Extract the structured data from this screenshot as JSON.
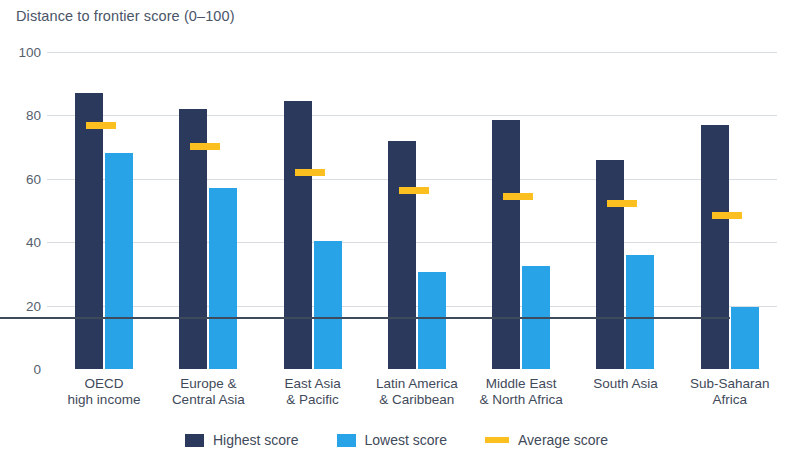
{
  "chart_data": {
    "type": "bar",
    "title": "Distance to frontier score (0–100)",
    "xlabel": "",
    "ylabel": "",
    "ylim": [
      0,
      100
    ],
    "yticks": [
      0,
      20,
      40,
      60,
      80,
      100
    ],
    "ytick_labels": [
      "0",
      "20",
      "40",
      "60",
      "80",
      "100"
    ],
    "grid": true,
    "legend_position": "bottom",
    "categories": [
      "OECD high income",
      "Europe & Central Asia",
      "East Asia & Pacific",
      "Latin America & Caribbean",
      "Middle East & North Africa",
      "South Asia",
      "Sub-Saharan Africa"
    ],
    "category_lines": [
      [
        "OECD",
        "high income"
      ],
      [
        "Europe &",
        "Central Asia"
      ],
      [
        "East Asia",
        "& Pacific"
      ],
      [
        "Latin America",
        "& Caribbean"
      ],
      [
        "Middle East",
        "& North Africa"
      ],
      [
        "South Asia"
      ],
      [
        "Sub-Saharan",
        "Africa"
      ]
    ],
    "series": [
      {
        "name": "Highest score",
        "color": "#2b3a5c",
        "values": [
          87,
          82,
          84.5,
          72,
          78.5,
          66,
          77
        ]
      },
      {
        "name": "Lowest score",
        "color": "#29a3e8",
        "values": [
          68,
          57,
          40.5,
          30.5,
          32.5,
          36,
          19.5
        ]
      },
      {
        "name": "Average score",
        "color": "#fbc01f",
        "marker": "line",
        "values": [
          77,
          70.5,
          62,
          56.5,
          54.5,
          52.5,
          48.5
        ]
      }
    ]
  },
  "colors": {
    "highest": "#2b3a5c",
    "lowest": "#29a3e8",
    "average": "#fbc01f",
    "gridline": "#d8dde3",
    "axis": "#3f4a5a",
    "text": "#3f4a5a",
    "title_text": "#4a5568"
  }
}
